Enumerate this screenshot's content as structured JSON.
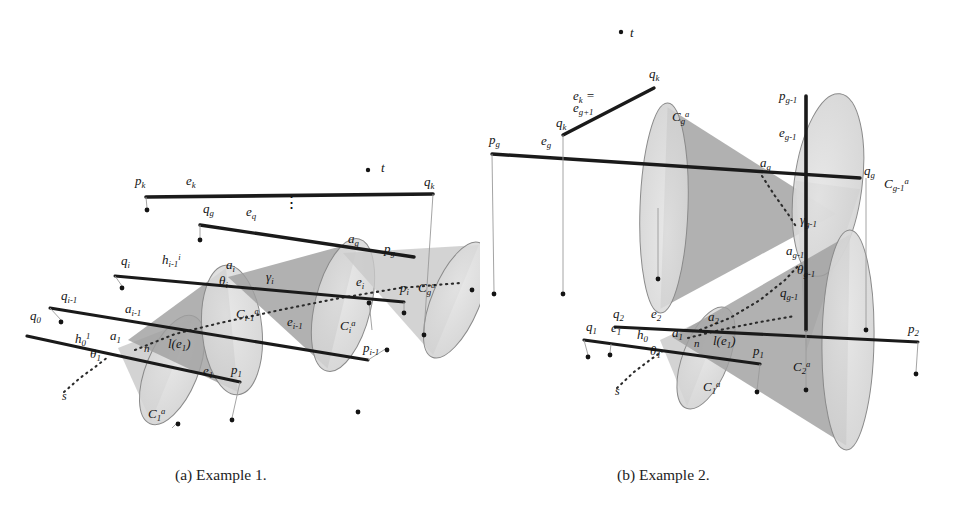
{
  "figure": {
    "captions": {
      "a": "(a) Example 1.",
      "b": "(b) Example 2."
    },
    "colors": {
      "cone_light": "#c9c9c9",
      "cone_dark": "#a0a0a0",
      "ellipse_fill": "#d8d8d8",
      "ellipse_stroke": "#8a8a8a",
      "segment": "#1a1a1a",
      "dotted": "#2b2b2b",
      "thin_leader": "#9a9a9a",
      "text": "#141414",
      "background": "#ffffff"
    }
  },
  "panel_a": {
    "name": "Example 1",
    "labels": [
      {
        "id": "t",
        "text": "t",
        "x": 381,
        "y": 172,
        "size": 13,
        "dot": {
          "x": 368,
          "y": 170
        }
      },
      {
        "id": "pk",
        "text": "p",
        "sub": "k",
        "x": 135,
        "y": 185
      },
      {
        "id": "ek",
        "text": "e",
        "sub": "k",
        "x": 186,
        "y": 185
      },
      {
        "id": "qk",
        "text": "q",
        "sub": "k",
        "x": 424,
        "y": 186
      },
      {
        "id": "qg",
        "text": "q",
        "sub": "g",
        "x": 203,
        "y": 213
      },
      {
        "id": "eg",
        "text": "e",
        "sub": "q",
        "x": 246,
        "y": 216
      },
      {
        "id": "ag",
        "text": "a",
        "sub": "g",
        "x": 348,
        "y": 243
      },
      {
        "id": "pg",
        "text": "p",
        "sub": "g",
        "x": 384,
        "y": 253
      },
      {
        "id": "qi",
        "text": "q",
        "sub": "i",
        "x": 121,
        "y": 265
      },
      {
        "id": "hi1",
        "text": "h",
        "sub": "i-1",
        "sup": "i",
        "x": 162,
        "y": 264
      },
      {
        "id": "ai",
        "text": "a",
        "sub": "i",
        "x": 226,
        "y": 269
      },
      {
        "id": "gammai",
        "text": "γ",
        "sub": "i",
        "x": 266,
        "y": 281
      },
      {
        "id": "thetai",
        "text": "θ",
        "sub": "i",
        "x": 219,
        "y": 285
      },
      {
        "id": "ei",
        "text": "e",
        "sub": "i",
        "x": 356,
        "y": 286
      },
      {
        "id": "pi",
        "text": "p",
        "sub": "i",
        "x": 400,
        "y": 292
      },
      {
        "id": "Cga",
        "text": "C",
        "sub": "g",
        "sup": "a",
        "x": 418,
        "y": 292
      },
      {
        "id": "qim1",
        "text": "q",
        "sub": "i-1",
        "x": 61,
        "y": 300
      },
      {
        "id": "aim1",
        "text": "a",
        "sub": "i-1",
        "x": 125,
        "y": 313
      },
      {
        "id": "q0",
        "text": "q",
        "sub": "0",
        "x": 30,
        "y": 320
      },
      {
        "id": "Cim1a",
        "text": "C",
        "sub": "i-1",
        "sup": "a",
        "x": 236,
        "y": 318
      },
      {
        "id": "eim1",
        "text": "e",
        "sub": "i-1",
        "x": 287,
        "y": 326
      },
      {
        "id": "Cia",
        "text": "C",
        "sub": "i",
        "sup": "a",
        "x": 340,
        "y": 330
      },
      {
        "id": "h01",
        "text": "h",
        "sub": "0",
        "sup": "1",
        "x": 75,
        "y": 343
      },
      {
        "id": "a1",
        "text": "a",
        "sub": "1",
        "x": 110,
        "y": 340
      },
      {
        "id": "n",
        "text": "n",
        "x": 144,
        "y": 352,
        "size": 11
      },
      {
        "id": "le1",
        "text": "l(e",
        "sub": "1",
        "tail": ")",
        "x": 168,
        "y": 348
      },
      {
        "id": "theta1",
        "text": "θ",
        "sub": "1",
        "x": 90,
        "y": 358
      },
      {
        "id": "pim1",
        "text": "p",
        "sub": "i-1",
        "x": 363,
        "y": 352
      },
      {
        "id": "e1",
        "text": "e",
        "sub": "1",
        "x": 203,
        "y": 375
      },
      {
        "id": "p1",
        "text": "p",
        "sub": "1",
        "x": 231,
        "y": 374
      },
      {
        "id": "s",
        "text": "s",
        "x": 62,
        "y": 400,
        "size": 12
      },
      {
        "id": "C1a",
        "text": "C",
        "sub": "1",
        "sup": "a",
        "x": 148,
        "y": 418
      }
    ],
    "segments": [
      {
        "id": "seg-ek",
        "x1": 146,
        "y1": 197,
        "x2": 433,
        "y2": 194,
        "w": 3.6
      },
      {
        "id": "seg-eg",
        "x1": 200,
        "y1": 225,
        "x2": 414,
        "y2": 257,
        "w": 3.4
      },
      {
        "id": "seg-ei",
        "x1": 115,
        "y1": 276,
        "x2": 404,
        "y2": 302,
        "w": 3.0
      },
      {
        "id": "seg-eim1",
        "x1": 50,
        "y1": 308,
        "x2": 368,
        "y2": 360,
        "w": 3.0
      },
      {
        "id": "seg-e1",
        "x1": 27,
        "y1": 336,
        "x2": 240,
        "y2": 382,
        "w": 3.2
      }
    ],
    "dotted_paths": [
      {
        "id": "dotted-axis",
        "points": "135,350 175,334 220,323 280,310 340,298 400,288 460,283"
      },
      {
        "id": "dotted-s",
        "points": "64,392 80,378 95,367 108,357"
      }
    ],
    "ellipsis": {
      "x": 283,
      "y": 208,
      "text": "⋮"
    },
    "cones": [
      {
        "id": "cone-1",
        "apex_x": 118,
        "apex_y": 348,
        "base_cx": 172,
        "base_cy": 370,
        "rx": 26,
        "ry": 58,
        "tone": "light"
      },
      {
        "id": "cone-2",
        "apex_x": 128,
        "apex_y": 340,
        "base_cx": 232,
        "base_cy": 330,
        "rx": 30,
        "ry": 65,
        "tone": "dark"
      },
      {
        "id": "cone-3",
        "apex_x": 228,
        "apex_y": 277,
        "base_cx": 343,
        "base_cy": 305,
        "rx": 28,
        "ry": 68,
        "tone": "dark"
      },
      {
        "id": "cone-4",
        "apex_x": 343,
        "apex_y": 253,
        "base_cx": 456,
        "base_cy": 300,
        "rx": 24,
        "ry": 62,
        "tone": "light"
      }
    ],
    "node_dots": [
      {
        "x": 147,
        "y": 210
      },
      {
        "x": 200,
        "y": 240
      },
      {
        "x": 122,
        "y": 288
      },
      {
        "x": 61,
        "y": 322
      },
      {
        "x": 369,
        "y": 303
      },
      {
        "x": 404,
        "y": 313
      },
      {
        "x": 387,
        "y": 350
      },
      {
        "x": 424,
        "y": 335
      },
      {
        "x": 472,
        "y": 290
      },
      {
        "x": 358,
        "y": 412
      },
      {
        "x": 232,
        "y": 420
      },
      {
        "x": 178,
        "y": 424
      }
    ]
  },
  "panel_b": {
    "name": "Example 2",
    "labels": [
      {
        "id": "t",
        "text": "t",
        "x": 630,
        "y": 37,
        "size": 13,
        "dot": {
          "x": 621,
          "y": 32
        }
      },
      {
        "id": "qk-top",
        "text": "q",
        "sub": "k",
        "x": 649,
        "y": 78
      },
      {
        "id": "ek-eq",
        "text": "e",
        "sub": "k",
        "tail": " =",
        "x": 573,
        "y": 100
      },
      {
        "id": "eg1",
        "text": "e",
        "sub": "g+1",
        "x": 573,
        "y": 112
      },
      {
        "id": "qk-low",
        "text": "q",
        "sub": "k",
        "x": 556,
        "y": 127
      },
      {
        "id": "pg",
        "text": "p",
        "sub": "g",
        "x": 489,
        "y": 144
      },
      {
        "id": "eg",
        "text": "e",
        "sub": "g",
        "x": 541,
        "y": 145
      },
      {
        "id": "Cga",
        "text": "C",
        "sub": "g",
        "sup": "a",
        "x": 672,
        "y": 121
      },
      {
        "id": "pgm1",
        "text": "p",
        "sub": "g-1",
        "x": 779,
        "y": 100
      },
      {
        "id": "egm1",
        "text": "e",
        "sub": "g-1",
        "x": 779,
        "y": 137
      },
      {
        "id": "ag",
        "text": "a",
        "sub": "g",
        "x": 760,
        "y": 167
      },
      {
        "id": "qg",
        "text": "q",
        "sub": "g",
        "x": 864,
        "y": 175
      },
      {
        "id": "Cgm1a",
        "text": "C",
        "sub": "g-1",
        "sup": "a",
        "x": 884,
        "y": 188
      },
      {
        "id": "gammagm1",
        "text": "γ",
        "sub": "g-1",
        "x": 800,
        "y": 224
      },
      {
        "id": "agm1",
        "text": "a",
        "sub": "g-1",
        "x": 786,
        "y": 255
      },
      {
        "id": "thetagm1",
        "text": "θ",
        "sub": "g-1",
        "x": 797,
        "y": 274
      },
      {
        "id": "qgm1",
        "text": "q",
        "sub": "g-1",
        "x": 780,
        "y": 297
      },
      {
        "id": "q2",
        "text": "q",
        "sub": "2",
        "x": 613,
        "y": 318
      },
      {
        "id": "e2",
        "text": "e",
        "sub": "2",
        "x": 651,
        "y": 318
      },
      {
        "id": "a2",
        "text": "a",
        "sub": "2",
        "x": 708,
        "y": 321
      },
      {
        "id": "q1",
        "text": "q",
        "sub": "1",
        "x": 586,
        "y": 331
      },
      {
        "id": "e1",
        "text": "e",
        "sub": "1",
        "x": 611,
        "y": 332
      },
      {
        "id": "h0",
        "text": "h",
        "sub": "0",
        "x": 637,
        "y": 339
      },
      {
        "id": "a1",
        "text": "a",
        "sub": "1",
        "x": 672,
        "y": 337
      },
      {
        "id": "n",
        "text": "n",
        "x": 694,
        "y": 347,
        "size": 11
      },
      {
        "id": "le1",
        "text": "l(e",
        "sub": "1",
        "tail": ")",
        "x": 713,
        "y": 345
      },
      {
        "id": "p1",
        "text": "p",
        "sub": "1",
        "x": 753,
        "y": 355
      },
      {
        "id": "theta1",
        "text": "θ",
        "sub": "1",
        "x": 650,
        "y": 355
      },
      {
        "id": "p2",
        "text": "p",
        "sub": "2",
        "x": 908,
        "y": 333
      },
      {
        "id": "C2a",
        "text": "C",
        "sub": "2",
        "sup": "a",
        "x": 793,
        "y": 371
      },
      {
        "id": "s",
        "text": "s",
        "x": 615,
        "y": 395,
        "size": 12
      },
      {
        "id": "C1a",
        "text": "C",
        "sub": "1",
        "sup": "a",
        "x": 703,
        "y": 391
      }
    ],
    "segments": [
      {
        "id": "seg-ekqk",
        "x1": 563,
        "y1": 135,
        "x2": 654,
        "y2": 88,
        "w": 3.4
      },
      {
        "id": "seg-eg",
        "x1": 492,
        "y1": 154,
        "x2": 860,
        "y2": 178,
        "w": 3.4
      },
      {
        "id": "seg-egm1",
        "x1": 806,
        "y1": 96,
        "x2": 806,
        "y2": 330,
        "w": 3.6
      },
      {
        "id": "seg-e2",
        "x1": 615,
        "y1": 327,
        "x2": 918,
        "y2": 342,
        "w": 3.0
      },
      {
        "id": "seg-e1",
        "x1": 584,
        "y1": 340,
        "x2": 760,
        "y2": 364,
        "w": 3.2
      }
    ],
    "dotted_paths": [
      {
        "id": "dotted-gam",
        "points": "762,176 775,196 788,214 797,228"
      },
      {
        "id": "dotted-axis",
        "points": "688,338 720,330 760,322 795,316"
      },
      {
        "id": "dotted-agm1",
        "points": "700,330 730,318 760,300 785,280 800,264"
      },
      {
        "id": "dotted-s",
        "points": "617,388 634,372 650,360 664,350"
      }
    ],
    "cones": [
      {
        "id": "cone-g",
        "apex_x": 836,
        "apex_y": 214,
        "base_cx": 664,
        "base_cy": 208,
        "rx": 24,
        "ry": 105,
        "tone": "dark"
      },
      {
        "id": "cone-gm1",
        "apex_x": 806,
        "apex_y": 352,
        "base_cx": 828,
        "base_cy": 185,
        "rx": 92,
        "ry": 34,
        "tone": "light"
      },
      {
        "id": "cone-1b",
        "apex_x": 660,
        "apex_y": 340,
        "base_cx": 706,
        "base_cy": 358,
        "rx": 23,
        "ry": 54,
        "tone": "light"
      },
      {
        "id": "cone-2b",
        "apex_x": 672,
        "apex_y": 337,
        "base_cx": 848,
        "base_cy": 340,
        "rx": 26,
        "ry": 110,
        "tone": "dark"
      }
    ],
    "node_dots": [
      {
        "x": 494,
        "y": 294
      },
      {
        "x": 563,
        "y": 294
      },
      {
        "x": 658,
        "y": 279
      },
      {
        "x": 588,
        "y": 357
      },
      {
        "x": 610,
        "y": 355
      },
      {
        "x": 757,
        "y": 392
      },
      {
        "x": 866,
        "y": 330
      },
      {
        "x": 916,
        "y": 374
      },
      {
        "x": 806,
        "y": 390
      }
    ]
  }
}
